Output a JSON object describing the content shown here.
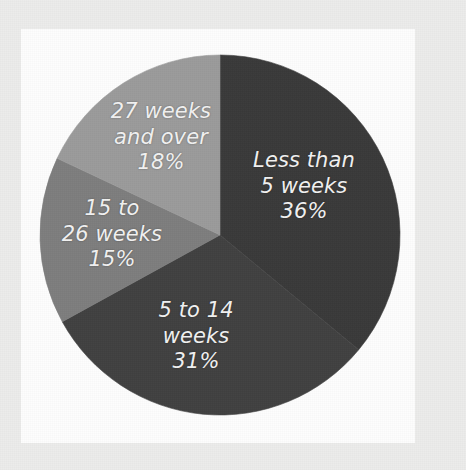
{
  "figure": {
    "background_color": "#ececeb",
    "panel_color": "#fdfdfd"
  },
  "chart_data": {
    "type": "pie",
    "title": "",
    "subtitle": "",
    "xlabel": "",
    "ylabel": "",
    "grid": false,
    "legend_position": "none",
    "labels_inside_slices": true,
    "start_angle_deg": 0,
    "direction": "clockwise",
    "units": "percent",
    "categories": [
      "Less than 5 weeks",
      "5 to 14 weeks",
      "15 to 26 weeks",
      "27 weeks and over"
    ],
    "values": [
      36,
      31,
      15,
      18
    ],
    "colors": [
      "#3a3a3a",
      "#414141",
      "#7d7d7d",
      "#9b9b9b"
    ],
    "slices": [
      {
        "name": "less-than-5-weeks",
        "label": "Less than\n5 weeks\n36%",
        "category": "Less than 5 weeks",
        "value": 36,
        "value_text": "36%",
        "color": "#3a3a3a"
      },
      {
        "name": "5-to-14-weeks",
        "label": "5 to 14\nweeks\n31%",
        "category": "5 to 14 weeks",
        "value": 31,
        "value_text": "31%",
        "color": "#414141"
      },
      {
        "name": "15-to-26-weeks",
        "label": "15 to\n26 weeks\n15%",
        "category": "15 to 26 weeks",
        "value": 15,
        "value_text": "15%",
        "color": "#7d7d7d"
      },
      {
        "name": "27-weeks-and-over",
        "label": "27 weeks\nand over\n18%",
        "category": "27 weeks and over",
        "value": 18,
        "value_text": "18%",
        "color": "#9b9b9b"
      }
    ]
  }
}
